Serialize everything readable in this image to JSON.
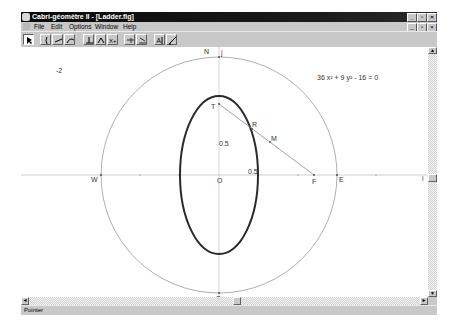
{
  "window": {
    "title": "Cabri-géomètre II - [Ladder.fig]",
    "controls": {
      "minimize": "_",
      "restore": "▫",
      "close": "×"
    }
  },
  "menubar": {
    "items": [
      {
        "label": "File"
      },
      {
        "label": "Edit"
      },
      {
        "label": "Options"
      },
      {
        "label": "Window"
      },
      {
        "label": "Help"
      }
    ],
    "doc_controls": {
      "minimize": "_",
      "restore": "▫",
      "close": "×"
    }
  },
  "toolbar": {
    "tools": [
      {
        "name": "pointer-tool",
        "pressed": true
      },
      {
        "name": "points-tool"
      },
      {
        "name": "lines-tool"
      },
      {
        "name": "curves-tool"
      },
      {
        "name": "construct-tool"
      },
      {
        "name": "transform-tool"
      },
      {
        "name": "macro-tool"
      },
      {
        "name": "check-property-tool"
      },
      {
        "name": "measure-tool"
      },
      {
        "name": "display-tool"
      },
      {
        "name": "draw-tool"
      }
    ]
  },
  "canvas": {
    "corner_value": "-2",
    "equation": "36 x² + 9 y² - 16 = 0",
    "points": {
      "N": "N",
      "S": "S",
      "W": "W",
      "E": "E",
      "O": "O",
      "T": "T",
      "F": "F",
      "R": "R",
      "M": "M",
      "i": "i",
      "j": "j"
    },
    "measures": {
      "vertical": "0.5",
      "horizontal": "0.5"
    },
    "colors": {
      "circle": "#9a9a9a",
      "ellipse": "#2a2a2a",
      "axes": "#a0a0a0",
      "segment": "#8a8a8a"
    }
  },
  "scrollbars": {
    "vertical": {
      "up": "▲",
      "down": "▼"
    },
    "horizontal": {
      "left": "◄",
      "right": "►"
    }
  },
  "statusbar": {
    "text": "Pointer"
  }
}
